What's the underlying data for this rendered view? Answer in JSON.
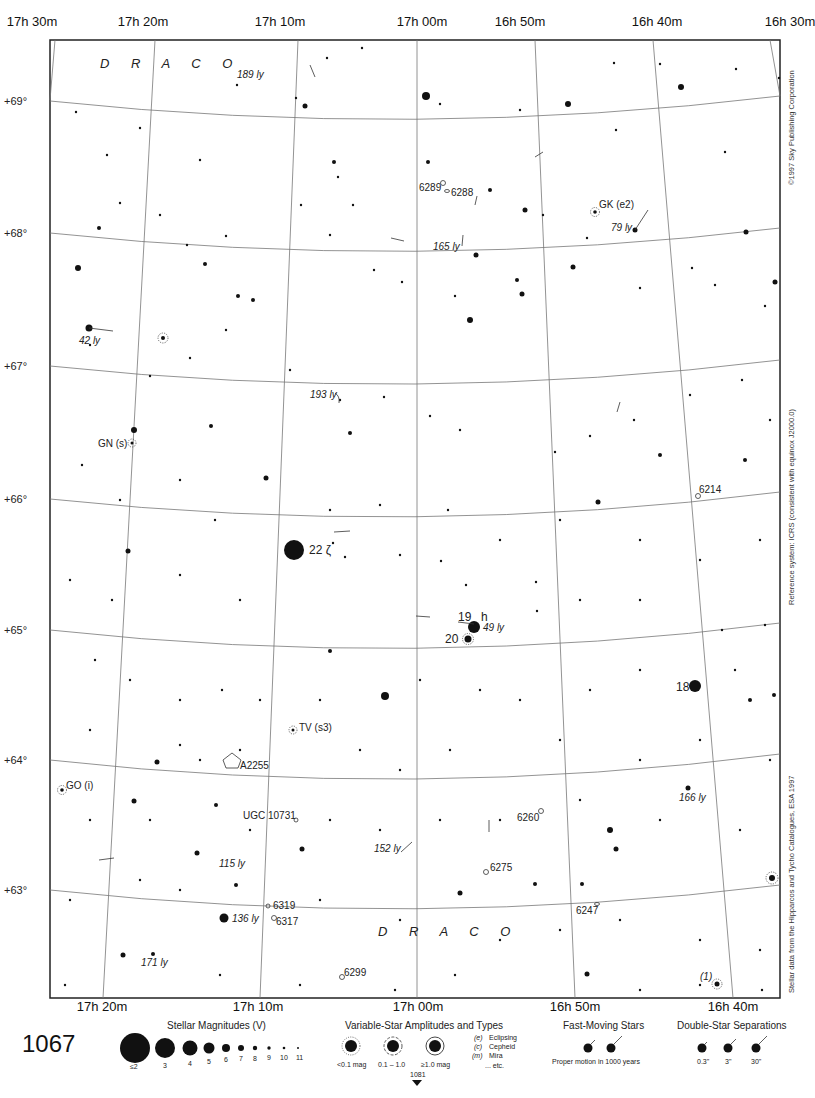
{
  "page": {
    "page_number": "1067",
    "next_page_ref": "1081",
    "copyright": "©1997 Sky Publishing Corporation",
    "reference_system": "Reference system: ICRS (consistent with equinox J2000.0)",
    "stellar_data_source": "Stellar data from the Hipparcos and Tycho Catalogues, ESA 1997"
  },
  "axes": {
    "ra_top": [
      {
        "h": "17",
        "m": "30",
        "x": 30
      },
      {
        "h": "17",
        "m": "20",
        "x": 255
      },
      {
        "h": "17",
        "m": "10",
        "x": 485
      },
      {
        "h": "17",
        "m": "00",
        "x": 0
      },
      {
        "h": "16",
        "m": "50",
        "x": 0
      },
      {
        "h": "16",
        "m": "40",
        "x": 0
      },
      {
        "h": "16",
        "m": "30",
        "x": 0
      }
    ],
    "ra_top_labels": [
      "17h 30m",
      "17h 20m",
      "17h 10m",
      "17h 00m",
      "16h 50m",
      "16h 40m",
      "16h 30m"
    ],
    "ra_bottom_labels": [
      "17h 20m",
      "17h 10m",
      "17h 00m",
      "16h 50m",
      "16h 40m"
    ],
    "dec_labels": [
      "+69°",
      "+68°",
      "+67°",
      "+66°",
      "+65°",
      "+64°",
      "+63°"
    ]
  },
  "constellation_labels": [
    "D R A C O",
    "D R A C O"
  ],
  "objects": {
    "stars_named": [
      {
        "id": "zeta",
        "label": "22 ζ"
      },
      {
        "id": "h19",
        "label": "19"
      },
      {
        "id": "h_letter",
        "label": "h"
      },
      {
        "id": "s20",
        "label": "20"
      },
      {
        "id": "s18",
        "label": "18"
      }
    ],
    "variable_stars": [
      "GK (e2)",
      "GN (s)",
      "TV (s3)",
      "GO (i)",
      "(1)"
    ],
    "deep_sky": [
      "6289",
      "6288",
      "6214",
      "A2255",
      "UGC 10731",
      "6260",
      "6275",
      "6319",
      "6317",
      "6247",
      "6299"
    ],
    "distances": [
      "189 ly",
      "165 ly",
      "79 ly",
      "42 ly",
      "193 ly",
      "49 ly",
      "166 ly",
      "152 ly",
      "115 ly",
      "136 ly",
      "171 ly"
    ]
  },
  "legend": {
    "magnitudes": {
      "title": "Stellar Magnitudes (V)",
      "steps": [
        "≤2",
        "3",
        "4",
        "5",
        "6",
        "7",
        "8",
        "9",
        "10",
        "11"
      ]
    },
    "variables": {
      "title": "Variable-Star Amplitudes and Types",
      "amplitudes": [
        "<0.1 mag",
        "0.1 – 1.0",
        "≥1.0 mag"
      ],
      "types": [
        {
          "code": "(e)",
          "name": "Eclipsing"
        },
        {
          "code": "(c)",
          "name": "Cepheid"
        },
        {
          "code": "(m)",
          "name": "Mira"
        },
        {
          "code": "",
          "name": "... etc."
        }
      ]
    },
    "fast_moving": {
      "title": "Fast-Moving Stars",
      "caption": "Proper motion in 1000 years"
    },
    "doubles": {
      "title": "Double-Star Separations",
      "steps": [
        "0.3\"",
        "3\"",
        "30\""
      ]
    }
  }
}
